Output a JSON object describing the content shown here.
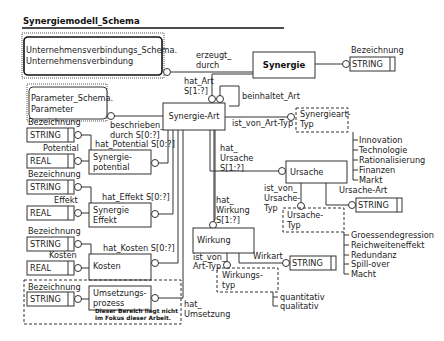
{
  "title": "Synergiemodell_Schema",
  "entities": {
    "unternehmensverbindung": {
      "line1": "Unternehmensverbindungs_Schema.",
      "line2": "Unternehmensverbindung"
    },
    "parameter": {
      "line1": "Parameter_Schema.",
      "line2": "Parameter"
    },
    "synergie": "Synergie",
    "synergie_art": "Synergie-Art",
    "synergiepotential": {
      "line1": "Synergie-",
      "line2": "potential"
    },
    "synergie_effekt": {
      "line1": "Synergie",
      "line2": "Effekt"
    },
    "kosten": "Kosten",
    "umsetzungsprozess": {
      "line1": "Umsetzungs-",
      "line2": "prozess"
    },
    "ursache": "Ursache",
    "wirkung": "Wirkung",
    "synergieart_typ": {
      "line1": "Synergieart-",
      "line2": "Typ"
    },
    "ursache_typ": {
      "line1": "Ursache-",
      "line2": "Typ"
    },
    "wirkungstyp": {
      "line1": "Wirkungs-",
      "line2": "typ"
    }
  },
  "attributes": {
    "synergie_bezeichnung": {
      "label": "Bezeichnung",
      "type": "STRING"
    },
    "potential_bezeichnung": {
      "label": "Bezeichnung",
      "type": "STRING"
    },
    "potential_value": {
      "label": "Potential",
      "type": "REAL"
    },
    "effekt_bezeichnung": {
      "label": "Bezeichnung",
      "type": "STRING"
    },
    "effekt_value": {
      "label": "Effekt",
      "type": "REAL"
    },
    "kosten_bezeichnung": {
      "label": "Bezeichnung",
      "type": "STRING"
    },
    "kosten_value": {
      "label": "Kosten",
      "type": "REAL"
    },
    "umsetzung_bezeichnung": {
      "label": "Bezeichnung",
      "type": "STRING"
    },
    "ursache_art": {
      "label": "Ursache-Art",
      "type": "STRING"
    },
    "wirkart": {
      "label": "Wirkart",
      "type": "STRING"
    }
  },
  "relations": {
    "erzeugt_durch": {
      "line1": "erzeugt_",
      "line2": "durch"
    },
    "hat_art": {
      "line1": "hat_Art",
      "line2": "S[1:?]"
    },
    "beinhaltet_art": "beinhaltet_Art",
    "beschrieben_durch": {
      "line1": "beschrieben_",
      "line2": "durch S[0:?]"
    },
    "ist_von_art_typ": "ist_von_Art-Typ",
    "hat_potential": "hat_Potential S[0:?]",
    "hat_effekt": "hat_Effekt S[0:?]",
    "hat_kosten": "hat_Kosten S[0:?]",
    "hat_ursache": {
      "line1": "hat_",
      "line2": "Ursache",
      "line3": "S[1:?]"
    },
    "hat_wirkung": {
      "line1": "hat_",
      "line2": "Wirkung",
      "line3": "S[1:?]"
    },
    "ist_von_ursache_typ": {
      "line1": "ist_von_",
      "line2": "Ursache-",
      "line3": "Typ"
    },
    "wirkung_ist_von_art_typ": {
      "line1": "ist_von_",
      "line2": "Art-Typ"
    },
    "hat_umsetzung": {
      "line1": "hat_",
      "line2": "Umsetzung"
    }
  },
  "enumerations": {
    "synergieart_typ": [
      "Innovation",
      "Technologie",
      "Rationalisierung",
      "Finanzen",
      "Markt"
    ],
    "ursache_typ": [
      "Groessendegression",
      "Reichweiteneffekt",
      "Redundanz",
      "Spill-over",
      "Macht"
    ],
    "wirkungstyp": [
      "quantitativ",
      "qualitativ"
    ]
  },
  "note": {
    "line1": "Dieser Bereich liegt nicht",
    "line2": "im Fokus dieser Arbeit."
  }
}
